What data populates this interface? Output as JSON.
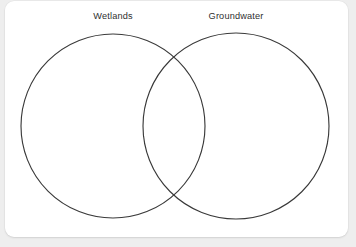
{
  "diagram": {
    "type": "venn",
    "title": "",
    "background_color": "#eeeeee",
    "card_color": "#ffffff",
    "stroke_color": "#3a3a3a",
    "label_color": "#2f2f2f",
    "sets": [
      {
        "id": "left",
        "label": "Wetlands",
        "items": [],
        "center_x": 108,
        "center_y": 125,
        "radius": 92
      },
      {
        "id": "right",
        "label": "Groundwater",
        "items": [],
        "center_x": 231,
        "center_y": 125,
        "radius": 93
      }
    ],
    "intersection": {
      "label": "",
      "items": []
    }
  }
}
